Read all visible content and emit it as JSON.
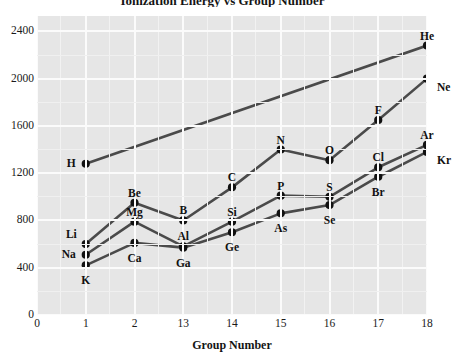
{
  "chart_data": {
    "type": "line",
    "title": "Ionization Energy vs Group Number",
    "xlabel": "Group Number",
    "ylabel": "",
    "xtick_labels": [
      "0",
      "1",
      "2",
      "13",
      "14",
      "15",
      "16",
      "17",
      "18"
    ],
    "xtick_values": [
      0,
      1,
      2,
      13,
      14,
      15,
      16,
      17,
      18
    ],
    "ytick_labels": [
      "0",
      "400",
      "800",
      "1200",
      "1600",
      "2000",
      "2400"
    ],
    "ylim": [
      0,
      2530
    ],
    "grid": true,
    "legend": false,
    "series": [
      {
        "name": "Period 1-2",
        "color": "#4a4a4a",
        "points": [
          {
            "x": 1,
            "y": 1280,
            "label": "H",
            "label_pos": "left"
          },
          {
            "x": 18,
            "y": 2280,
            "label": "He",
            "label_pos": "above"
          }
        ]
      },
      {
        "name": "Period 2",
        "color": "#4a4a4a",
        "points": [
          {
            "x": 1,
            "y": 600,
            "label": "Li",
            "label_pos": "above-left"
          },
          {
            "x": 2,
            "y": 950,
            "label": "Be",
            "label_pos": "above"
          },
          {
            "x": 13,
            "y": 800,
            "label": "B",
            "label_pos": "above"
          },
          {
            "x": 14,
            "y": 1080,
            "label": "C",
            "label_pos": "above"
          },
          {
            "x": 15,
            "y": 1400,
            "label": "N",
            "label_pos": "above"
          },
          {
            "x": 16,
            "y": 1310,
            "label": "O",
            "label_pos": "above"
          },
          {
            "x": 17,
            "y": 1650,
            "label": "F",
            "label_pos": "above"
          },
          {
            "x": 18,
            "y": 2000,
            "label": "Ne",
            "label_pos": "below-right"
          }
        ]
      },
      {
        "name": "Period 3",
        "color": "#4a4a4a",
        "points": [
          {
            "x": 1,
            "y": 510,
            "label": "Na",
            "label_pos": "left"
          },
          {
            "x": 2,
            "y": 790,
            "label": "Mg",
            "label_pos": "above"
          },
          {
            "x": 13,
            "y": 580,
            "label": "Al",
            "label_pos": "above"
          },
          {
            "x": 14,
            "y": 790,
            "label": "Si",
            "label_pos": "above"
          },
          {
            "x": 15,
            "y": 1010,
            "label": "P",
            "label_pos": "above"
          },
          {
            "x": 16,
            "y": 1000,
            "label": "S",
            "label_pos": "above"
          },
          {
            "x": 17,
            "y": 1250,
            "label": "Cl",
            "label_pos": "above"
          },
          {
            "x": 18,
            "y": 1440,
            "label": "Ar",
            "label_pos": "above"
          }
        ]
      },
      {
        "name": "Period 4",
        "color": "#4a4a4a",
        "points": [
          {
            "x": 1,
            "y": 420,
            "label": "K",
            "label_pos": "below"
          },
          {
            "x": 2,
            "y": 610,
            "label": "Ca",
            "label_pos": "below"
          },
          {
            "x": 13,
            "y": 570,
            "label": "Ga",
            "label_pos": "below"
          },
          {
            "x": 14,
            "y": 700,
            "label": "Ge",
            "label_pos": "below"
          },
          {
            "x": 15,
            "y": 860,
            "label": "As",
            "label_pos": "below"
          },
          {
            "x": 16,
            "y": 930,
            "label": "Se",
            "label_pos": "below"
          },
          {
            "x": 17,
            "y": 1170,
            "label": "Br",
            "label_pos": "below"
          },
          {
            "x": 18,
            "y": 1380,
            "label": "Kr",
            "label_pos": "below-right"
          }
        ]
      }
    ]
  }
}
